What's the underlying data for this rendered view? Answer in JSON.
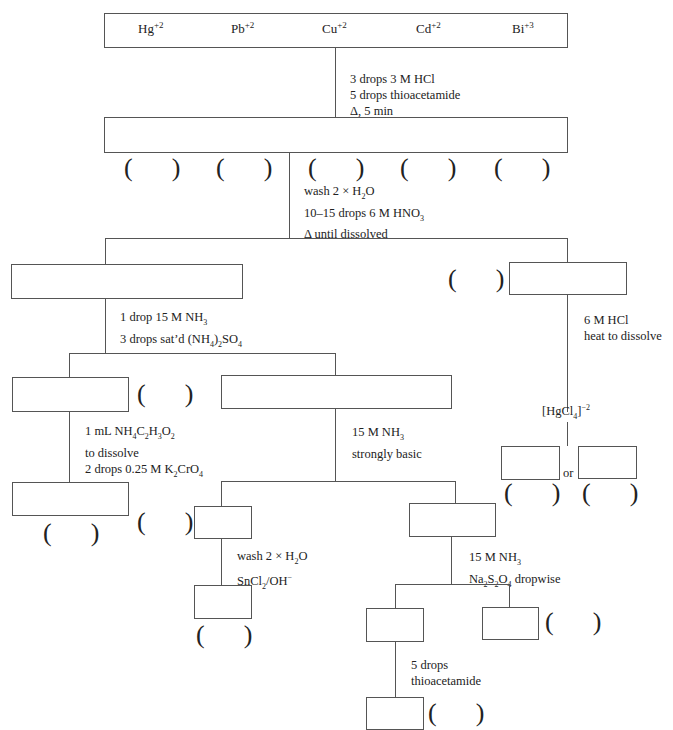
{
  "ions": [
    {
      "symbol": "Hg",
      "charge": "+2"
    },
    {
      "symbol": "Pb",
      "charge": "+2"
    },
    {
      "symbol": "Cu",
      "charge": "+2"
    },
    {
      "symbol": "Cd",
      "charge": "+2"
    },
    {
      "symbol": "Bi",
      "charge": "+3"
    }
  ],
  "steps": {
    "step1": [
      "3 drops 3 M HCl",
      "5 drops thioacetamide",
      "Δ, 5 min"
    ],
    "step2": {
      "line1_pre": "wash 2 × H",
      "line1_sub": "2",
      "line1_post": "O",
      "line2_pre": "10–15 drops 6 M HNO",
      "line2_sub": "3",
      "line3": "Δ until dissolved"
    },
    "step3": {
      "line1_pre": "1 drop 15 M NH",
      "line1_sub": "3",
      "line2_pre": "3 drops sat’d (NH",
      "line2_sub1": "4",
      "line2_mid": ")",
      "line2_sub2": "2",
      "line2_post": "SO",
      "line2_sub3": "4"
    },
    "step_hg": {
      "line1": "6 M HCl",
      "line2": "heat to dissolve"
    },
    "hgcl4": {
      "pre": "[HgCl",
      "sub": "4",
      "post": "]",
      "sup": "−2"
    },
    "step_pb": {
      "line1_pre": "1 mL NH",
      "line1_s1": "4",
      "line1_m1": "C",
      "line1_s2": "2",
      "line1_m2": "H",
      "line1_s3": "3",
      "line1_m3": "O",
      "line1_s4": "2",
      "line2": "to dissolve",
      "line3_pre": "2 drops 0.25 M K",
      "line3_s1": "2",
      "line3_m": "CrO",
      "line3_s2": "4"
    },
    "step_nh3": {
      "line1_pre": "15 M NH",
      "line1_sub": "3",
      "line2": "strongly basic"
    },
    "step_bi": {
      "line1_pre": "wash 2 × H",
      "line1_sub": "2",
      "line1_post": "O",
      "line2_pre": "SnCl",
      "line2_sub": "2",
      "line2_post": "/OH",
      "line2_sup": "−"
    },
    "step_cu": {
      "line1_pre": "15 M NH",
      "line1_sub": "3",
      "line2_a": "Na",
      "line2_s1": "2",
      "line2_b": "S",
      "line2_s2": "2",
      "line2_c": "O",
      "line2_s3": "4",
      "line2_post": " dropwise"
    },
    "step_cd": {
      "line1": "5 drops",
      "line2": "thioacetamide"
    }
  },
  "or_label": "or",
  "blank_paren": "(      )"
}
